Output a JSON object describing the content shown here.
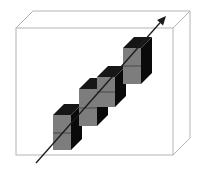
{
  "figure": {
    "type": "3d-box-with-stacked-cubes",
    "colors": {
      "background": "#ffffff",
      "box_edge": "#b4b4b4",
      "cube_front": "#7d7d7d",
      "cube_side": "#0a0a0a",
      "cube_top": "#161616",
      "cube_divider": "#4a4a4a",
      "arrow": "#1a1a1a"
    },
    "box": {
      "front": {
        "x": 16,
        "y": 28,
        "w": 157,
        "h": 127
      },
      "depth_offset": {
        "dx": 17,
        "dy": -17
      }
    },
    "cube_columns": [
      {
        "x": 53,
        "y": 115,
        "w": 18,
        "h": 35,
        "depth": 11
      },
      {
        "x": 79,
        "y": 89,
        "w": 18,
        "h": 37,
        "depth": 11
      },
      {
        "x": 97,
        "y": 77,
        "w": 18,
        "h": 30,
        "depth": 11
      },
      {
        "x": 123,
        "y": 48,
        "w": 18,
        "h": 36,
        "depth": 11
      }
    ],
    "arrow": {
      "x1": 36,
      "y1": 163,
      "x2": 166,
      "y2": 16
    }
  },
  "caption": {
    "text": "",
    "clipped": true
  }
}
